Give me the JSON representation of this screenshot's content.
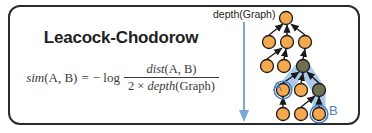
{
  "card": {
    "title": "Leacock-Chodorow",
    "border_color": "#2b2b2b",
    "background": "#ffffff"
  },
  "formula": {
    "lhs": "sim",
    "lhs_args": "(A, B)",
    "equals": "=",
    "neg_log": "− log",
    "numerator_fn": "dist",
    "numerator_args": "(A, B)",
    "denominator_prefix": "2 × ",
    "denominator_fn": "depth",
    "denominator_args": "(Graph)",
    "text_color": "#3a3a3a"
  },
  "depth_annotation": {
    "label": "depth(Graph)",
    "arrow_color": "#7ba7d7",
    "direction": "down"
  },
  "graph": {
    "node_fill": "#f5a94e",
    "node_stroke": "#1a1a1a",
    "path_node_fill": "#6f6f52",
    "edge_color": "#1a1a1a",
    "highlight_color": "#a8c6e8",
    "marker_stroke": "#4a7fbf",
    "labels": [
      {
        "text": "A",
        "color": "#4a7fbf"
      },
      {
        "text": "B",
        "color": "#4a7fbf"
      }
    ],
    "nodes": [
      {
        "id": "root",
        "x": 50,
        "y": 14,
        "type": "normal"
      },
      {
        "id": "n2a",
        "x": 33,
        "y": 38,
        "type": "normal"
      },
      {
        "id": "n2b",
        "x": 51,
        "y": 38,
        "type": "normal"
      },
      {
        "id": "n2c",
        "x": 69,
        "y": 38,
        "type": "normal"
      },
      {
        "id": "n3a",
        "x": 31,
        "y": 62,
        "type": "normal"
      },
      {
        "id": "n3b",
        "x": 48,
        "y": 62,
        "type": "normal"
      },
      {
        "id": "lcs",
        "x": 67,
        "y": 62,
        "type": "path"
      },
      {
        "id": "nodeA",
        "x": 47,
        "y": 86,
        "type": "marked"
      },
      {
        "id": "n4b",
        "x": 65,
        "y": 86,
        "type": "normal"
      },
      {
        "id": "n4c",
        "x": 83,
        "y": 86,
        "type": "path"
      },
      {
        "id": "n5a",
        "x": 47,
        "y": 110,
        "type": "normal"
      },
      {
        "id": "n5b",
        "x": 65,
        "y": 110,
        "type": "normal"
      },
      {
        "id": "nodeB",
        "x": 83,
        "y": 110,
        "type": "marked"
      }
    ],
    "edges": [
      [
        "n2a",
        "root"
      ],
      [
        "n2b",
        "root"
      ],
      [
        "n2c",
        "root"
      ],
      [
        "n3a",
        "n2b"
      ],
      [
        "n3b",
        "n2b"
      ],
      [
        "lcs",
        "n2c"
      ],
      [
        "nodeA",
        "lcs"
      ],
      [
        "n4b",
        "lcs"
      ],
      [
        "n4c",
        "lcs"
      ],
      [
        "n5a",
        "nodeA"
      ],
      [
        "nodeB",
        "n4c"
      ],
      [
        "n5b",
        "n4c"
      ]
    ]
  }
}
